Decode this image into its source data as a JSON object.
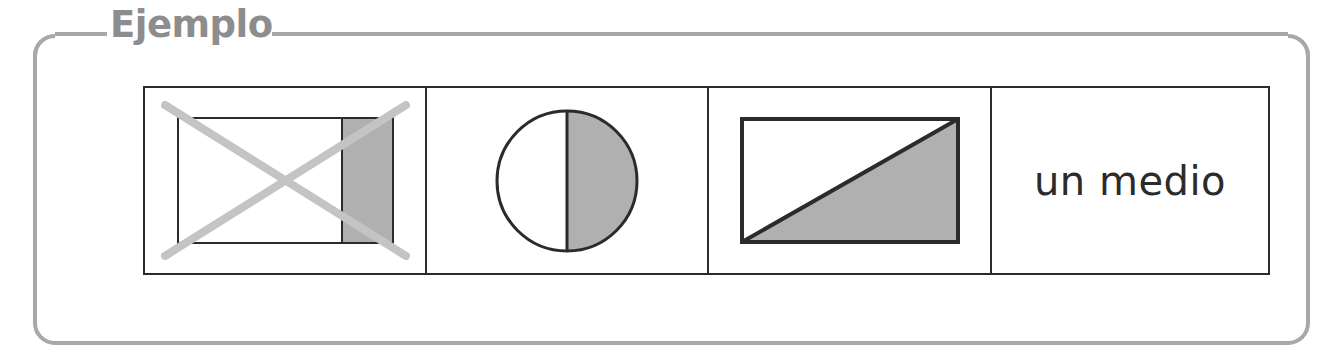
{
  "panel": {
    "legend_label": "Ejemplo",
    "border_color": "#a8a8a8",
    "legend_color": "#8d8d8d"
  },
  "table": {
    "stroke_color": "#2b2b2b",
    "shade_color": "#b0b0b0",
    "cross_out_color": "#c4c4c4",
    "cells": [
      {
        "name": "rectangle-one-quarter-shaded-crossed-out",
        "figure_type": "rectangle",
        "shaded_fraction": "1/4",
        "crossed_out": true,
        "description": "rectangulo dividido en cuatro partes con una parte sombreada, tachado"
      },
      {
        "name": "circle-one-half-shaded",
        "figure_type": "circle",
        "shaded_fraction": "1/2",
        "crossed_out": false,
        "description": "circulo dividido en dos mitades con una mitad sombreada"
      },
      {
        "name": "rectangle-one-half-shaded",
        "figure_type": "rectangle-diagonal",
        "shaded_fraction": "1/2",
        "crossed_out": false,
        "description": "rectangulo dividido por una diagonal con la mitad inferior sombreada"
      },
      {
        "name": "fraction-name-label",
        "figure_type": "text",
        "text": "un medio"
      }
    ]
  }
}
